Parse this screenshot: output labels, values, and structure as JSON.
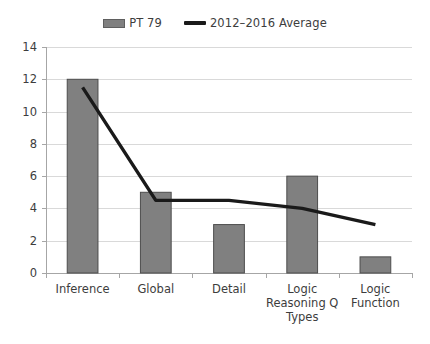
{
  "legend": {
    "position": "top-center",
    "entries": [
      {
        "label": "PT 79",
        "marker": "bar-swatch-icon",
        "color": "#808080"
      },
      {
        "label": "2012–2016 Average",
        "marker": "line-swatch-icon",
        "color": "#1a1a1a"
      }
    ]
  },
  "axis": {
    "y_ticks": [
      "0",
      "2",
      "4",
      "6",
      "8",
      "10",
      "12",
      "14"
    ],
    "x_labels": [
      [
        "Inference"
      ],
      [
        "Global"
      ],
      [
        "Detail"
      ],
      [
        "Logic",
        "Reasoning Q",
        "Types"
      ],
      [
        "Logic",
        "Function"
      ]
    ]
  },
  "chart_data": {
    "type": "bar",
    "title": "",
    "subtitle": "",
    "xlabel": "",
    "ylabel": "",
    "categories": [
      "Inference",
      "Global",
      "Detail",
      "Logic Reasoning Q Types",
      "Logic Function"
    ],
    "series": [
      {
        "name": "PT 79",
        "type": "bar",
        "color": "#808080",
        "values": [
          12,
          5,
          3,
          6,
          1
        ]
      },
      {
        "name": "2012–2016 Average",
        "type": "line",
        "color": "#1a1a1a",
        "values": [
          11.5,
          4.5,
          4.5,
          4.0,
          3.0
        ]
      }
    ],
    "ylim": [
      0,
      14
    ],
    "ytick_step": 2,
    "grid": true,
    "grid_axis": "y",
    "legend_position": "top-center"
  },
  "colors": {
    "bar_fill": "#808080",
    "bar_stroke": "#4d4d4d",
    "line": "#1a1a1a",
    "gridline": "#d9d9d9",
    "axis": "#a6a6a6",
    "text": "#3d3d3d",
    "background": "#ffffff"
  }
}
